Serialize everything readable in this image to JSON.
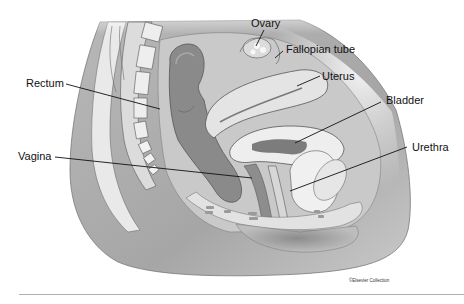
{
  "figure": {
    "labels": [
      {
        "id": "ovary",
        "text": "Ovary"
      },
      {
        "id": "fallopian-tube",
        "text": "Fallopian tube"
      },
      {
        "id": "uterus",
        "text": "Uterus"
      },
      {
        "id": "rectum",
        "text": "Rectum"
      },
      {
        "id": "bladder",
        "text": "Bladder"
      },
      {
        "id": "vagina",
        "text": "Vagina"
      },
      {
        "id": "urethra",
        "text": "Urethra"
      }
    ],
    "credit": "©Elsevier Collection",
    "caption_faint": "..."
  },
  "colors": {
    "background": "#ffffff",
    "body_gray": "#a9a9a9",
    "light_tissue": "#e8e8e8",
    "organ_mid": "#bdbdbd",
    "organ_dark": "#7e7e7e",
    "outline": "#555555",
    "leader_line": "#111111"
  }
}
